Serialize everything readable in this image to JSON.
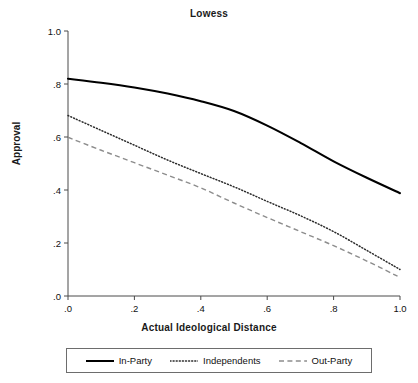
{
  "chart_data": {
    "type": "line",
    "title": "Lowess",
    "xlabel": "Actual Ideological Distance",
    "ylabel": "Approval",
    "xlim": [
      0,
      1
    ],
    "ylim": [
      0,
      1
    ],
    "xticks": [
      0,
      0.2,
      0.4,
      0.6,
      0.8,
      1
    ],
    "xticklabels": [
      ".0",
      ".2",
      ".4",
      ".6",
      ".8",
      "1.0"
    ],
    "yticks": [
      0,
      0.2,
      0.4,
      0.6,
      0.8,
      1
    ],
    "yticklabels": [
      ".0",
      ".2",
      ".4",
      ".6",
      ".8",
      "1.0"
    ],
    "grid": false,
    "legend_position": "bottom",
    "x": [
      0,
      0.1,
      0.2,
      0.3,
      0.4,
      0.5,
      0.6,
      0.7,
      0.8,
      0.9,
      1
    ],
    "series": [
      {
        "name": "In-Party",
        "style": "solid",
        "color": "#000000",
        "values": [
          0.82,
          0.805,
          0.787,
          0.764,
          0.735,
          0.698,
          0.643,
          0.578,
          0.508,
          0.446,
          0.388
        ]
      },
      {
        "name": "Independents",
        "style": "dotted",
        "color": "#2b2b2b",
        "values": [
          0.681,
          0.625,
          0.569,
          0.513,
          0.462,
          0.412,
          0.357,
          0.303,
          0.243,
          0.172,
          0.1
        ]
      },
      {
        "name": "Out-Party",
        "style": "dashed",
        "color": "#8d8d8d",
        "values": [
          0.599,
          0.55,
          0.503,
          0.456,
          0.408,
          0.351,
          0.296,
          0.243,
          0.19,
          0.132,
          0.07
        ]
      }
    ]
  },
  "legend": {
    "entries": [
      {
        "label": "In-Party",
        "sample": "solid-line-sample"
      },
      {
        "label": "Independents",
        "sample": "dotted-line-sample"
      },
      {
        "label": "Out-Party",
        "sample": "dashed-line-sample"
      }
    ]
  }
}
